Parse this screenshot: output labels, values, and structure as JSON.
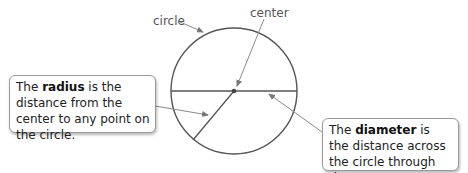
{
  "labels": {
    "circle": "circle",
    "center": "center"
  },
  "callouts": {
    "radius": {
      "prefix": "The ",
      "term": "radius",
      "suffix": " is the distance from the center to any point on the circle."
    },
    "diameter": {
      "prefix": "The ",
      "term": "diameter",
      "suffix": " is the distance across the circle through the center."
    }
  },
  "colors": {
    "stroke": "#555555",
    "arrow": "#8a8a8a",
    "label_text": "#555555",
    "box_border": "#9a9a9a"
  }
}
